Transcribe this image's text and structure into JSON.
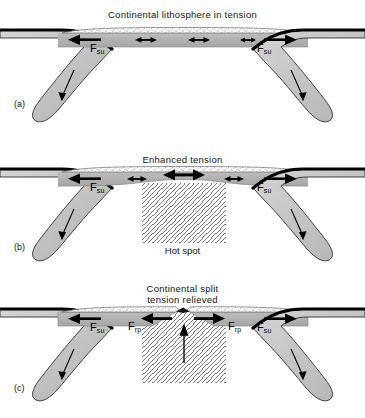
{
  "figure": {
    "type": "geological-cross-section-diagram",
    "panels": [
      {
        "id": "a",
        "letter": "(a)",
        "title": "Continental lithosphere in tension",
        "title_lines": [
          "Continental lithosphere in tension"
        ],
        "force_labels": [
          {
            "name": "F",
            "sub": "su",
            "side": "left",
            "arrow": "left"
          },
          {
            "name": "F",
            "sub": "su",
            "side": "right",
            "arrow": "right"
          }
        ],
        "tension_arrows": 3,
        "hot_spot": false,
        "hot_spot_label": "",
        "split": false
      },
      {
        "id": "b",
        "letter": "(b)",
        "title": "Enhanced tension",
        "title_lines": [
          "Enhanced tension"
        ],
        "force_labels": [
          {
            "name": "F",
            "sub": "su",
            "side": "left",
            "arrow": "left"
          },
          {
            "name": "F",
            "sub": "su",
            "side": "right",
            "arrow": "right"
          }
        ],
        "tension_arrows": 3,
        "hot_spot": true,
        "hot_spot_label": "Hot spot",
        "split": false
      },
      {
        "id": "c",
        "letter": "(c)",
        "title": "Continental split tension relieved",
        "title_lines": [
          "Continental split",
          "tension relieved"
        ],
        "force_labels": [
          {
            "name": "F",
            "sub": "su",
            "side": "left",
            "arrow": "left"
          },
          {
            "name": "F",
            "sub": "rp",
            "side": "center-left",
            "arrow": "left"
          },
          {
            "name": "F",
            "sub": "rp",
            "side": "center-right",
            "arrow": "right"
          },
          {
            "name": "F",
            "sub": "su",
            "side": "right",
            "arrow": "right"
          }
        ],
        "tension_arrows": 0,
        "hot_spot": true,
        "hot_spot_label": "",
        "split": true
      }
    ],
    "legend_terms": {
      "f_su": "Fsu",
      "f_rp": "Frp",
      "hot_spot": "Hot spot"
    },
    "colors": {
      "crust_fill": "#ffffff",
      "crust_stipple": "#5a5a5a",
      "mantle_lithosphere": "#b0b0b0",
      "slab_fill": "#c9c9c9",
      "slab_edge": "#000000",
      "hot_spot_hatch": "#6d6d6d",
      "arrow": "#000000",
      "background": "#ffffff",
      "text": "#161616"
    }
  }
}
